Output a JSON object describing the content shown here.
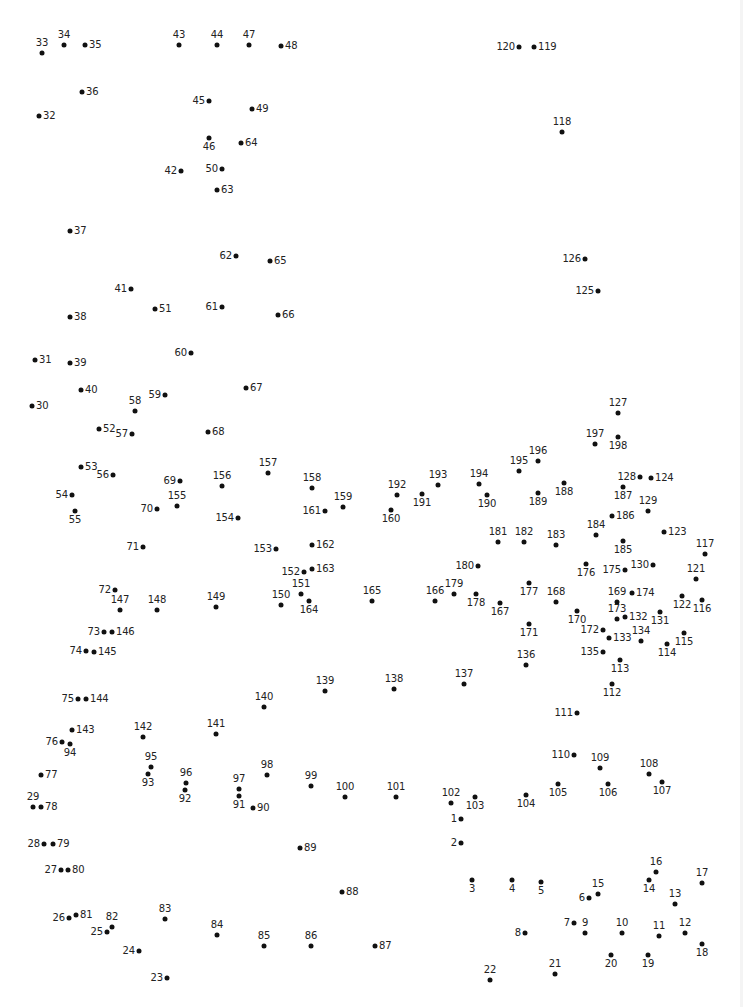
{
  "worksheet": {
    "type": "connect-the-dots",
    "dot_color": "#111111",
    "label_color": "#222222",
    "background": "#ffffff",
    "points": [
      {
        "n": "1",
        "x": 461,
        "y": 819,
        "pos": "l"
      },
      {
        "n": "2",
        "x": 461,
        "y": 843,
        "pos": "l"
      },
      {
        "n": "3",
        "x": 472,
        "y": 880,
        "pos": "b"
      },
      {
        "n": "4",
        "x": 512,
        "y": 880,
        "pos": "b"
      },
      {
        "n": "5",
        "x": 541,
        "y": 882,
        "pos": "b"
      },
      {
        "n": "6",
        "x": 589,
        "y": 898,
        "pos": "l"
      },
      {
        "n": "7",
        "x": 574,
        "y": 923,
        "pos": "l"
      },
      {
        "n": "8",
        "x": 525,
        "y": 933,
        "pos": "l"
      },
      {
        "n": "9",
        "x": 585,
        "y": 933,
        "pos": "t"
      },
      {
        "n": "10",
        "x": 622,
        "y": 933,
        "pos": "t"
      },
      {
        "n": "11",
        "x": 659,
        "y": 936,
        "pos": "t"
      },
      {
        "n": "12",
        "x": 685,
        "y": 933,
        "pos": "t"
      },
      {
        "n": "13",
        "x": 675,
        "y": 904,
        "pos": "t"
      },
      {
        "n": "14",
        "x": 649,
        "y": 880,
        "pos": "b"
      },
      {
        "n": "15",
        "x": 598,
        "y": 894,
        "pos": "t"
      },
      {
        "n": "16",
        "x": 656,
        "y": 872,
        "pos": "t"
      },
      {
        "n": "17",
        "x": 702,
        "y": 883,
        "pos": "t"
      },
      {
        "n": "18",
        "x": 702,
        "y": 944,
        "pos": "b"
      },
      {
        "n": "19",
        "x": 648,
        "y": 955,
        "pos": "b"
      },
      {
        "n": "20",
        "x": 611,
        "y": 955,
        "pos": "b"
      },
      {
        "n": "21",
        "x": 555,
        "y": 974,
        "pos": "t"
      },
      {
        "n": "22",
        "x": 490,
        "y": 980,
        "pos": "t"
      },
      {
        "n": "23",
        "x": 167,
        "y": 978,
        "pos": "l"
      },
      {
        "n": "24",
        "x": 139,
        "y": 951,
        "pos": "l"
      },
      {
        "n": "25",
        "x": 107,
        "y": 932,
        "pos": "l"
      },
      {
        "n": "26",
        "x": 69,
        "y": 918,
        "pos": "l"
      },
      {
        "n": "27",
        "x": 61,
        "y": 870,
        "pos": "l"
      },
      {
        "n": "28",
        "x": 44,
        "y": 844,
        "pos": "l"
      },
      {
        "n": "29",
        "x": 33,
        "y": 807,
        "pos": "t"
      },
      {
        "n": "30",
        "x": 32,
        "y": 406,
        "pos": "r"
      },
      {
        "n": "31",
        "x": 35,
        "y": 360,
        "pos": "r"
      },
      {
        "n": "32",
        "x": 39,
        "y": 116,
        "pos": "r"
      },
      {
        "n": "33",
        "x": 42,
        "y": 53,
        "pos": "t"
      },
      {
        "n": "34",
        "x": 64,
        "y": 45,
        "pos": "t"
      },
      {
        "n": "35",
        "x": 85,
        "y": 45,
        "pos": "r"
      },
      {
        "n": "36",
        "x": 82,
        "y": 92,
        "pos": "r"
      },
      {
        "n": "37",
        "x": 70,
        "y": 231,
        "pos": "r"
      },
      {
        "n": "38",
        "x": 70,
        "y": 317,
        "pos": "r"
      },
      {
        "n": "39",
        "x": 70,
        "y": 363,
        "pos": "r"
      },
      {
        "n": "40",
        "x": 81,
        "y": 390,
        "pos": "r"
      },
      {
        "n": "41",
        "x": 131,
        "y": 289,
        "pos": "l"
      },
      {
        "n": "42",
        "x": 181,
        "y": 171,
        "pos": "l"
      },
      {
        "n": "43",
        "x": 179,
        "y": 45,
        "pos": "t"
      },
      {
        "n": "44",
        "x": 217,
        "y": 45,
        "pos": "t"
      },
      {
        "n": "45",
        "x": 209,
        "y": 101,
        "pos": "l"
      },
      {
        "n": "46",
        "x": 209,
        "y": 138,
        "pos": "b"
      },
      {
        "n": "47",
        "x": 249,
        "y": 45,
        "pos": "t"
      },
      {
        "n": "48",
        "x": 281,
        "y": 46,
        "pos": "r"
      },
      {
        "n": "49",
        "x": 252,
        "y": 109,
        "pos": "r"
      },
      {
        "n": "50",
        "x": 222,
        "y": 169,
        "pos": "l"
      },
      {
        "n": "51",
        "x": 155,
        "y": 309,
        "pos": "r"
      },
      {
        "n": "52",
        "x": 99,
        "y": 429,
        "pos": "r"
      },
      {
        "n": "53",
        "x": 81,
        "y": 467,
        "pos": "r"
      },
      {
        "n": "54",
        "x": 72,
        "y": 495,
        "pos": "l"
      },
      {
        "n": "55",
        "x": 75,
        "y": 511,
        "pos": "b"
      },
      {
        "n": "56",
        "x": 113,
        "y": 475,
        "pos": "l"
      },
      {
        "n": "57",
        "x": 132,
        "y": 434,
        "pos": "l"
      },
      {
        "n": "58",
        "x": 135,
        "y": 411,
        "pos": "t"
      },
      {
        "n": "59",
        "x": 165,
        "y": 395,
        "pos": "l"
      },
      {
        "n": "60",
        "x": 191,
        "y": 353,
        "pos": "l"
      },
      {
        "n": "61",
        "x": 222,
        "y": 307,
        "pos": "l"
      },
      {
        "n": "62",
        "x": 236,
        "y": 256,
        "pos": "l"
      },
      {
        "n": "63",
        "x": 217,
        "y": 190,
        "pos": "r"
      },
      {
        "n": "64",
        "x": 241,
        "y": 143,
        "pos": "r"
      },
      {
        "n": "65",
        "x": 270,
        "y": 261,
        "pos": "r"
      },
      {
        "n": "66",
        "x": 278,
        "y": 315,
        "pos": "r"
      },
      {
        "n": "67",
        "x": 246,
        "y": 388,
        "pos": "r"
      },
      {
        "n": "68",
        "x": 208,
        "y": 432,
        "pos": "r"
      },
      {
        "n": "69",
        "x": 180,
        "y": 481,
        "pos": "l"
      },
      {
        "n": "70",
        "x": 157,
        "y": 509,
        "pos": "l"
      },
      {
        "n": "71",
        "x": 143,
        "y": 547,
        "pos": "l"
      },
      {
        "n": "72",
        "x": 115,
        "y": 590,
        "pos": "l"
      },
      {
        "n": "73",
        "x": 104,
        "y": 632,
        "pos": "l"
      },
      {
        "n": "74",
        "x": 86,
        "y": 651,
        "pos": "l"
      },
      {
        "n": "75",
        "x": 78,
        "y": 699,
        "pos": "l"
      },
      {
        "n": "76",
        "x": 62,
        "y": 742,
        "pos": "l"
      },
      {
        "n": "77",
        "x": 41,
        "y": 775,
        "pos": "r"
      },
      {
        "n": "78",
        "x": 41,
        "y": 807,
        "pos": "r"
      },
      {
        "n": "79",
        "x": 53,
        "y": 844,
        "pos": "r"
      },
      {
        "n": "80",
        "x": 68,
        "y": 870,
        "pos": "r"
      },
      {
        "n": "81",
        "x": 76,
        "y": 915,
        "pos": "r"
      },
      {
        "n": "82",
        "x": 112,
        "y": 927,
        "pos": "t"
      },
      {
        "n": "83",
        "x": 165,
        "y": 919,
        "pos": "t"
      },
      {
        "n": "84",
        "x": 217,
        "y": 935,
        "pos": "t"
      },
      {
        "n": "85",
        "x": 264,
        "y": 946,
        "pos": "t"
      },
      {
        "n": "86",
        "x": 311,
        "y": 946,
        "pos": "t"
      },
      {
        "n": "87",
        "x": 375,
        "y": 946,
        "pos": "r"
      },
      {
        "n": "88",
        "x": 342,
        "y": 892,
        "pos": "r"
      },
      {
        "n": "89",
        "x": 300,
        "y": 848,
        "pos": "r"
      },
      {
        "n": "90",
        "x": 253,
        "y": 808,
        "pos": "r"
      },
      {
        "n": "91",
        "x": 239,
        "y": 796,
        "pos": "b"
      },
      {
        "n": "92",
        "x": 185,
        "y": 790,
        "pos": "b"
      },
      {
        "n": "93",
        "x": 148,
        "y": 774,
        "pos": "b"
      },
      {
        "n": "94",
        "x": 70,
        "y": 744,
        "pos": "b"
      },
      {
        "n": "95",
        "x": 151,
        "y": 767,
        "pos": "t"
      },
      {
        "n": "96",
        "x": 186,
        "y": 783,
        "pos": "t"
      },
      {
        "n": "97",
        "x": 239,
        "y": 789,
        "pos": "t"
      },
      {
        "n": "98",
        "x": 267,
        "y": 775,
        "pos": "t"
      },
      {
        "n": "99",
        "x": 311,
        "y": 786,
        "pos": "t"
      },
      {
        "n": "100",
        "x": 345,
        "y": 797,
        "pos": "t"
      },
      {
        "n": "101",
        "x": 396,
        "y": 797,
        "pos": "t"
      },
      {
        "n": "102",
        "x": 451,
        "y": 803,
        "pos": "t"
      },
      {
        "n": "103",
        "x": 475,
        "y": 797,
        "pos": "b"
      },
      {
        "n": "104",
        "x": 526,
        "y": 795,
        "pos": "b"
      },
      {
        "n": "105",
        "x": 558,
        "y": 784,
        "pos": "b"
      },
      {
        "n": "106",
        "x": 608,
        "y": 784,
        "pos": "b"
      },
      {
        "n": "107",
        "x": 662,
        "y": 782,
        "pos": "b"
      },
      {
        "n": "108",
        "x": 649,
        "y": 774,
        "pos": "t"
      },
      {
        "n": "109",
        "x": 600,
        "y": 768,
        "pos": "t"
      },
      {
        "n": "110",
        "x": 574,
        "y": 755,
        "pos": "l"
      },
      {
        "n": "111",
        "x": 577,
        "y": 713,
        "pos": "l"
      },
      {
        "n": "112",
        "x": 612,
        "y": 684,
        "pos": "b"
      },
      {
        "n": "113",
        "x": 620,
        "y": 660,
        "pos": "b"
      },
      {
        "n": "114",
        "x": 667,
        "y": 644,
        "pos": "b"
      },
      {
        "n": "115",
        "x": 684,
        "y": 633,
        "pos": "b"
      },
      {
        "n": "116",
        "x": 702,
        "y": 600,
        "pos": "b"
      },
      {
        "n": "117",
        "x": 705,
        "y": 554,
        "pos": "t"
      },
      {
        "n": "118",
        "x": 562,
        "y": 132,
        "pos": "t"
      },
      {
        "n": "119",
        "x": 534,
        "y": 47,
        "pos": "r"
      },
      {
        "n": "120",
        "x": 519,
        "y": 47,
        "pos": "l"
      },
      {
        "n": "121",
        "x": 696,
        "y": 579,
        "pos": "t"
      },
      {
        "n": "122",
        "x": 682,
        "y": 596,
        "pos": "b"
      },
      {
        "n": "123",
        "x": 664,
        "y": 532,
        "pos": "r"
      },
      {
        "n": "124",
        "x": 651,
        "y": 478,
        "pos": "r"
      },
      {
        "n": "125",
        "x": 598,
        "y": 291,
        "pos": "l"
      },
      {
        "n": "126",
        "x": 585,
        "y": 259,
        "pos": "l"
      },
      {
        "n": "127",
        "x": 618,
        "y": 413,
        "pos": "t"
      },
      {
        "n": "128",
        "x": 640,
        "y": 477,
        "pos": "l"
      },
      {
        "n": "129",
        "x": 648,
        "y": 511,
        "pos": "t"
      },
      {
        "n": "130",
        "x": 653,
        "y": 565,
        "pos": "l"
      },
      {
        "n": "131",
        "x": 660,
        "y": 612,
        "pos": "b"
      },
      {
        "n": "132",
        "x": 625,
        "y": 617,
        "pos": "r"
      },
      {
        "n": "133",
        "x": 609,
        "y": 638,
        "pos": "r"
      },
      {
        "n": "134",
        "x": 641,
        "y": 641,
        "pos": "t"
      },
      {
        "n": "135",
        "x": 603,
        "y": 652,
        "pos": "l"
      },
      {
        "n": "136",
        "x": 526,
        "y": 665,
        "pos": "t"
      },
      {
        "n": "137",
        "x": 464,
        "y": 684,
        "pos": "t"
      },
      {
        "n": "138",
        "x": 394,
        "y": 689,
        "pos": "t"
      },
      {
        "n": "139",
        "x": 325,
        "y": 691,
        "pos": "t"
      },
      {
        "n": "140",
        "x": 264,
        "y": 707,
        "pos": "t"
      },
      {
        "n": "141",
        "x": 216,
        "y": 734,
        "pos": "t"
      },
      {
        "n": "142",
        "x": 143,
        "y": 737,
        "pos": "t"
      },
      {
        "n": "143",
        "x": 72,
        "y": 730,
        "pos": "r"
      },
      {
        "n": "144",
        "x": 86,
        "y": 699,
        "pos": "r"
      },
      {
        "n": "145",
        "x": 94,
        "y": 652,
        "pos": "r"
      },
      {
        "n": "146",
        "x": 112,
        "y": 632,
        "pos": "r"
      },
      {
        "n": "147",
        "x": 120,
        "y": 610,
        "pos": "t"
      },
      {
        "n": "148",
        "x": 157,
        "y": 610,
        "pos": "t"
      },
      {
        "n": "149",
        "x": 216,
        "y": 607,
        "pos": "t"
      },
      {
        "n": "150",
        "x": 281,
        "y": 605,
        "pos": "t"
      },
      {
        "n": "151",
        "x": 301,
        "y": 594,
        "pos": "t"
      },
      {
        "n": "152",
        "x": 304,
        "y": 572,
        "pos": "l"
      },
      {
        "n": "153",
        "x": 276,
        "y": 549,
        "pos": "l"
      },
      {
        "n": "154",
        "x": 238,
        "y": 518,
        "pos": "l"
      },
      {
        "n": "155",
        "x": 177,
        "y": 506,
        "pos": "t"
      },
      {
        "n": "156",
        "x": 222,
        "y": 486,
        "pos": "t"
      },
      {
        "n": "157",
        "x": 268,
        "y": 473,
        "pos": "t"
      },
      {
        "n": "158",
        "x": 312,
        "y": 488,
        "pos": "t"
      },
      {
        "n": "159",
        "x": 343,
        "y": 507,
        "pos": "t"
      },
      {
        "n": "160",
        "x": 391,
        "y": 510,
        "pos": "b"
      },
      {
        "n": "161",
        "x": 325,
        "y": 511,
        "pos": "l"
      },
      {
        "n": "162",
        "x": 312,
        "y": 545,
        "pos": "r"
      },
      {
        "n": "163",
        "x": 312,
        "y": 569,
        "pos": "r"
      },
      {
        "n": "164",
        "x": 309,
        "y": 601,
        "pos": "b"
      },
      {
        "n": "165",
        "x": 372,
        "y": 601,
        "pos": "t"
      },
      {
        "n": "166",
        "x": 435,
        "y": 601,
        "pos": "t"
      },
      {
        "n": "167",
        "x": 500,
        "y": 603,
        "pos": "b"
      },
      {
        "n": "168",
        "x": 556,
        "y": 602,
        "pos": "t"
      },
      {
        "n": "169",
        "x": 617,
        "y": 602,
        "pos": "t"
      },
      {
        "n": "170",
        "x": 577,
        "y": 611,
        "pos": "b"
      },
      {
        "n": "171",
        "x": 529,
        "y": 624,
        "pos": "b"
      },
      {
        "n": "172",
        "x": 603,
        "y": 630,
        "pos": "l"
      },
      {
        "n": "173",
        "x": 617,
        "y": 619,
        "pos": "t"
      },
      {
        "n": "174",
        "x": 632,
        "y": 593,
        "pos": "r"
      },
      {
        "n": "175",
        "x": 625,
        "y": 570,
        "pos": "l"
      },
      {
        "n": "176",
        "x": 586,
        "y": 564,
        "pos": "b"
      },
      {
        "n": "177",
        "x": 529,
        "y": 583,
        "pos": "b"
      },
      {
        "n": "178",
        "x": 476,
        "y": 594,
        "pos": "b"
      },
      {
        "n": "179",
        "x": 454,
        "y": 594,
        "pos": "t"
      },
      {
        "n": "180",
        "x": 478,
        "y": 566,
        "pos": "l"
      },
      {
        "n": "181",
        "x": 498,
        "y": 542,
        "pos": "t"
      },
      {
        "n": "182",
        "x": 524,
        "y": 542,
        "pos": "t"
      },
      {
        "n": "183",
        "x": 556,
        "y": 545,
        "pos": "t"
      },
      {
        "n": "184",
        "x": 596,
        "y": 535,
        "pos": "t"
      },
      {
        "n": "185",
        "x": 623,
        "y": 541,
        "pos": "b"
      },
      {
        "n": "186",
        "x": 612,
        "y": 516,
        "pos": "r"
      },
      {
        "n": "187",
        "x": 623,
        "y": 487,
        "pos": "b"
      },
      {
        "n": "188",
        "x": 564,
        "y": 483,
        "pos": "b"
      },
      {
        "n": "189",
        "x": 538,
        "y": 493,
        "pos": "b"
      },
      {
        "n": "190",
        "x": 487,
        "y": 495,
        "pos": "b"
      },
      {
        "n": "191",
        "x": 422,
        "y": 494,
        "pos": "b"
      },
      {
        "n": "192",
        "x": 397,
        "y": 495,
        "pos": "t"
      },
      {
        "n": "193",
        "x": 438,
        "y": 485,
        "pos": "t"
      },
      {
        "n": "194",
        "x": 479,
        "y": 484,
        "pos": "t"
      },
      {
        "n": "195",
        "x": 519,
        "y": 471,
        "pos": "t"
      },
      {
        "n": "196",
        "x": 538,
        "y": 461,
        "pos": "t"
      },
      {
        "n": "197",
        "x": 595,
        "y": 444,
        "pos": "t"
      },
      {
        "n": "198",
        "x": 618,
        "y": 437,
        "pos": "b"
      }
    ]
  }
}
